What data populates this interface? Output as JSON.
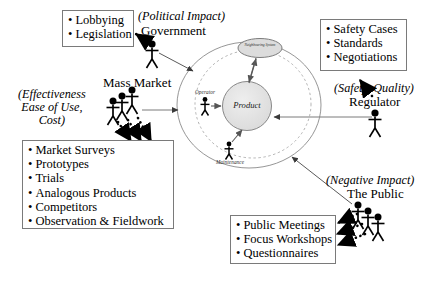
{
  "diagram": {
    "title_absent": true,
    "center": {
      "product_label": "Product",
      "neighbouring_system_label": "Neighbouring System",
      "operator_label": "Operator",
      "maintenance_label": "Maintenance"
    },
    "stakeholders": [
      {
        "id": "government",
        "name": "Government",
        "note": "(Political Impact)",
        "figures": 1,
        "methods_box": {
          "items": [
            "Lobbying",
            "Legislation"
          ]
        }
      },
      {
        "id": "mass-market",
        "name": "Mass Market",
        "note": "(Effectiveness\nEase of Use,\nCost)",
        "note_lines": [
          "(Effectiveness",
          "Ease of Use,",
          "Cost)"
        ],
        "figures": 3,
        "methods_box": {
          "items": [
            "Market Surveys",
            "Prototypes",
            "Trials",
            "Analogous Products",
            "Competitors",
            "Observation & Fieldwork"
          ]
        }
      },
      {
        "id": "regulator",
        "name": "Regulator",
        "note": "(Safety, Quality)",
        "figures": 1,
        "methods_box": {
          "items": [
            "Safety Cases",
            "Standards",
            "Negotiations"
          ]
        }
      },
      {
        "id": "the-public",
        "name": "The Public",
        "note": "(Negative Impact)",
        "figures": 3,
        "methods_box": {
          "items": [
            "Public Meetings",
            "Focus Workshops",
            "Questionnaires"
          ]
        }
      }
    ],
    "colors": {
      "line": "#555555",
      "box_border": "#7a7a7a",
      "product_fill": "#e0e0e0",
      "ellipse_fill": "#dcdcdc",
      "arrow_dotted": "#000000",
      "background": "#ffffff"
    }
  }
}
